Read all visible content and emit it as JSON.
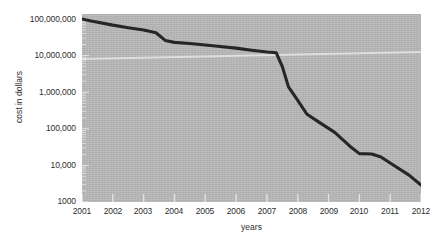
{
  "chart_data": {
    "type": "line",
    "title": "",
    "xlabel": "years",
    "ylabel": "cost in dollars",
    "yscale": "log",
    "ylim": [
      1000,
      100000000
    ],
    "xlim": [
      2001,
      2012
    ],
    "grid": false,
    "legend": null,
    "y_tick_labels": [
      "100,000,000",
      "10,000,000",
      "1,000,000",
      "100,000",
      "10,000",
      "1000"
    ],
    "y_tick_values": [
      100000000,
      10000000,
      1000000,
      100000,
      10000,
      1000
    ],
    "x_tick_labels": [
      "2001",
      "2002",
      "2003",
      "2004",
      "2005",
      "2006",
      "2007",
      "2008",
      "2009",
      "2010",
      "2011",
      "2012"
    ],
    "x_tick_values": [
      2001,
      2002,
      2003,
      2004,
      2005,
      2006,
      2007,
      2008,
      2009,
      2010,
      2011,
      2012
    ],
    "series": [
      {
        "name": "cost",
        "color": "#262626",
        "x": [
          2001.0,
          2001.3,
          2002.0,
          2002.5,
          2003.0,
          2003.4,
          2003.7,
          2004.0,
          2004.5,
          2005.0,
          2005.4,
          2006.0,
          2006.5,
          2007.0,
          2007.3,
          2007.5,
          2007.7,
          2008.0,
          2008.3,
          2008.7,
          2009.2,
          2009.7,
          2010.0,
          2010.4,
          2010.7,
          2011.2,
          2011.6,
          2012.0
        ],
        "y": [
          100000000,
          88000000,
          68000000,
          58000000,
          50000000,
          42000000,
          26000000,
          23000000,
          21500000,
          19500000,
          18000000,
          16000000,
          14000000,
          12500000,
          12000000,
          5000000,
          1400000,
          600000,
          250000,
          150000,
          80000,
          33000,
          21000,
          20500,
          17000,
          9000,
          5500,
          2900
        ]
      }
    ],
    "annotations": [],
    "background_color": "#b9b9b9",
    "line_color": "#262626"
  },
  "axes": {
    "y_title": "cost in dollars",
    "x_title": "years"
  }
}
